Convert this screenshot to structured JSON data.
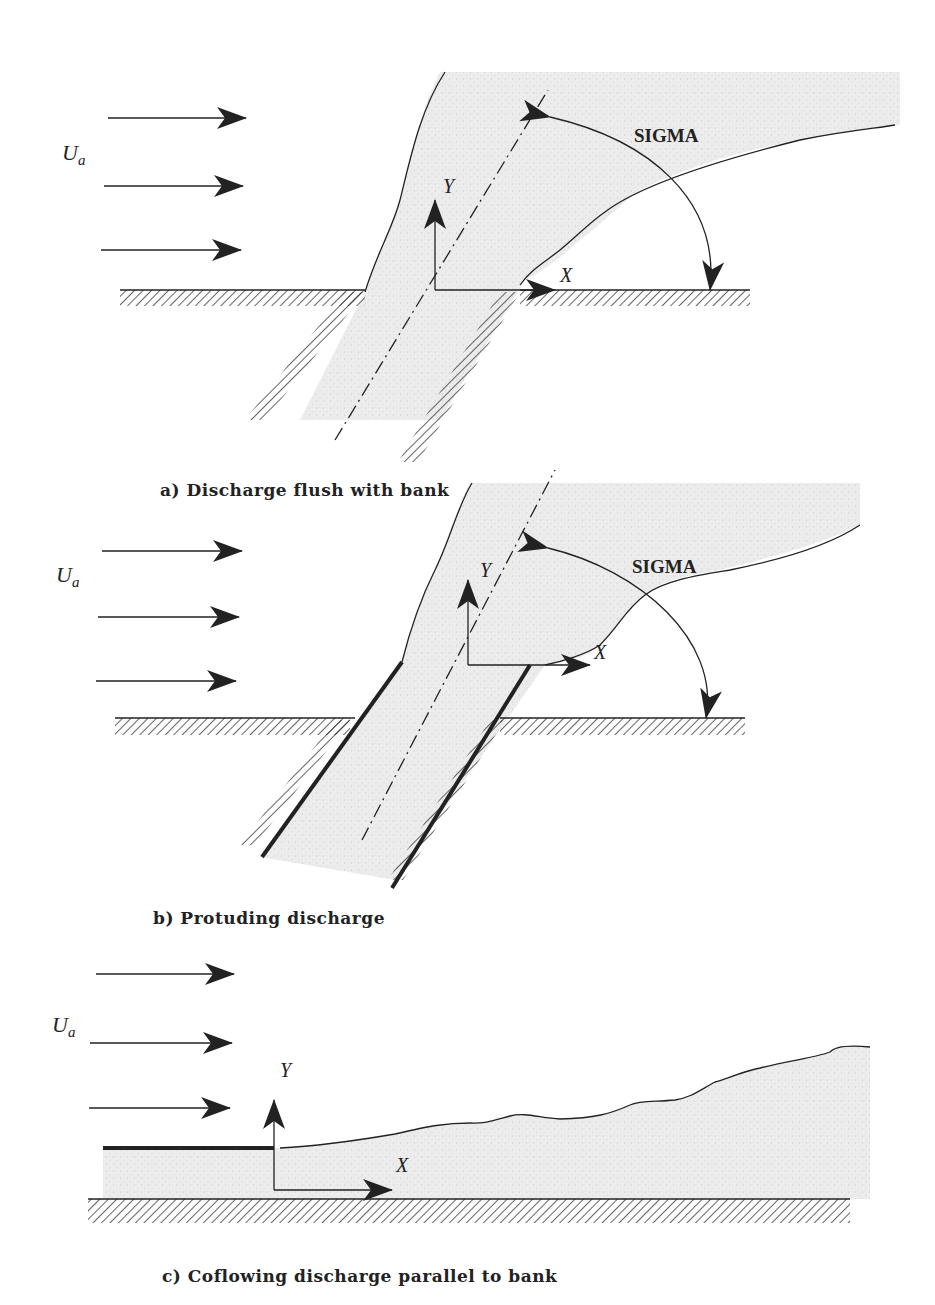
{
  "figure": {
    "panels": [
      {
        "id": "a",
        "caption": "a) Discharge flush with bank",
        "ambient_label": "U",
        "ambient_subscript": "a",
        "axis_x": "X",
        "axis_y": "Y",
        "angle_label": "SIGMA"
      },
      {
        "id": "b",
        "caption": "b) Protuding discharge",
        "ambient_label": "U",
        "ambient_subscript": "a",
        "axis_x": "X",
        "axis_y": "Y",
        "angle_label": "SIGMA"
      },
      {
        "id": "c",
        "caption": "c) Coflowing discharge parallel to bank",
        "ambient_label": "U",
        "ambient_subscript": "a",
        "axis_x": "X",
        "axis_y": "Y"
      }
    ],
    "colors": {
      "ink": "#222222",
      "plume_fill": "#ececec",
      "background": "#ffffff"
    }
  }
}
